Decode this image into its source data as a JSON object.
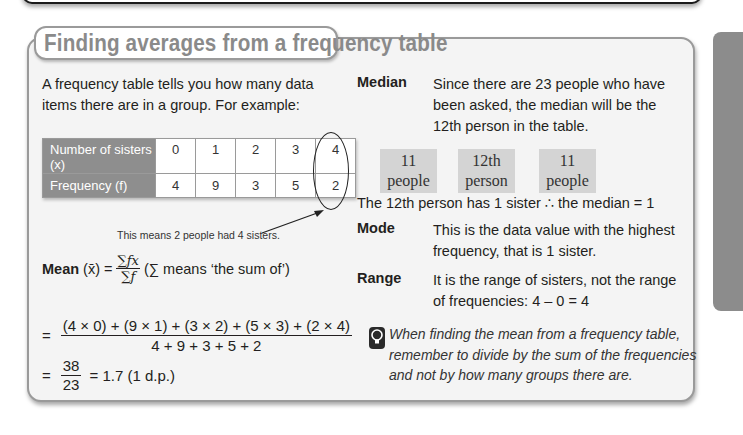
{
  "section": {
    "title": "Finding averages from a frequency table",
    "intro": "A frequency table tells you how many data items there are in a group. For example:"
  },
  "table": {
    "row_headers": [
      "Number of sisters (x)",
      "Frequency (f)"
    ],
    "x_values": [
      "0",
      "1",
      "2",
      "3",
      "4"
    ],
    "f_values": [
      "4",
      "9",
      "3",
      "5",
      "2"
    ],
    "annotation": "This means 2 people had 4 sisters."
  },
  "mean": {
    "label": "Mean",
    "symbol": "(x̄) =",
    "frac_num": "∑fx",
    "frac_den": "∑f",
    "sum_note": "(∑ means ‘the sum of’)",
    "calc_num": "(4 × 0) + (9 × 1) + (3 × 2) + (5 × 3) + (2 × 4)",
    "calc_den": "4 + 9 + 3 + 5 + 2",
    "result_num": "38",
    "result_den": "23",
    "result": "= 1.7 (1 d.p.)",
    "eq": "="
  },
  "median": {
    "label": "Median",
    "text": "Since there are 23 people who have been asked, the median will be the 12th person in the table.",
    "boxes": [
      {
        "line1": "11",
        "line2": "people"
      },
      {
        "line1": "12th",
        "line2": "person"
      },
      {
        "line1": "11",
        "line2": "people"
      }
    ],
    "conclusion": "The 12th person has 1 sister ∴ the median = 1"
  },
  "mode": {
    "label": "Mode",
    "text": "This is the data value with the highest frequency, that is 1 sister."
  },
  "range": {
    "label": "Range",
    "text": "It is the range of sisters, not the range of frequencies: 4 – 0 = 4"
  },
  "tip": {
    "icon": "lightbulb-icon",
    "text": "When finding the mean from a frequency table, remember to divide by the sum of the frequencies and not by how many groups there are."
  }
}
